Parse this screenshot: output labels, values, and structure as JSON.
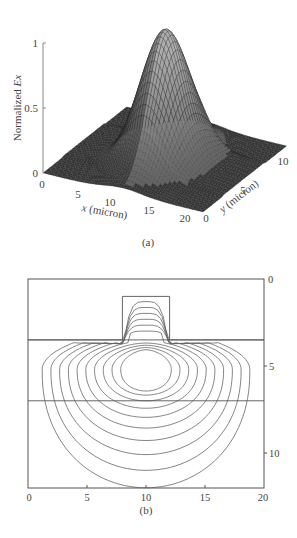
{
  "chart_data": [
    {
      "panel": "(a)",
      "type": "surface",
      "title": "",
      "xlabel": "x (micron)",
      "ylabel": "y (micron)",
      "zlabel_prefix": "Normalized ",
      "zlabel_italic": "Ex",
      "x_ticks": [
        "0",
        "5",
        "10",
        "15",
        "20"
      ],
      "y_ticks": [
        "0",
        "5",
        "10"
      ],
      "z_ticks": [
        "0",
        "0.5",
        "1"
      ],
      "xlim": [
        0,
        20
      ],
      "ylim": [
        0,
        11
      ],
      "zlim": [
        0,
        1
      ],
      "peak": {
        "x": 10,
        "y": 5.5,
        "z": 1.0
      },
      "description": "Normalized Ex field of rib waveguide fundamental mode; single Gaussian-like peak near x=10, y~5.5"
    },
    {
      "panel": "(b)",
      "type": "contour",
      "title": "",
      "xlabel": "",
      "ylabel": "",
      "x_ticks": [
        "0",
        "5",
        "10",
        "15",
        "20"
      ],
      "y_ticks": [
        "0",
        "5",
        "10"
      ],
      "xlim": [
        0,
        20
      ],
      "ylim": [
        0,
        12
      ],
      "y_inverted": true,
      "structure": {
        "rib": {
          "x_left": 8,
          "x_right": 12,
          "y_top": 1.0,
          "y_bottom": 3.5
        },
        "slab_top_y": 3.5,
        "slab_bottom_y": 7.0
      },
      "contour_levels": 10,
      "field_center": {
        "x": 10,
        "y": 5.2
      }
    }
  ],
  "captions": {
    "a": "(a)",
    "b": "(b)"
  }
}
